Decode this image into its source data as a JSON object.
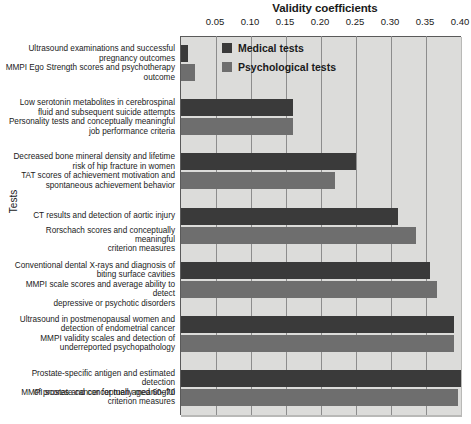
{
  "chart_data": {
    "type": "bar",
    "orientation": "horizontal",
    "title": "Validity coefficients",
    "xlabel": "Validity coefficients",
    "ylabel": "Tests",
    "xlim": [
      0.0,
      0.4
    ],
    "xticks": [
      0.05,
      0.1,
      0.15,
      0.2,
      0.25,
      0.3,
      0.35,
      0.4
    ],
    "xtick_labels": [
      "0.05",
      "0.10",
      "0.15",
      "0.20",
      "0.25",
      "0.30",
      "0.35",
      "0.40"
    ],
    "grid": true,
    "legend_position": "upper-center-inside",
    "categories": [
      "Ultrasound examinations and successful pregnancy outcomes",
      "MMPI Ego Strength scores and psychotherapy outcome",
      "Low serotonin metabolites in cerebrospinal fluid and subsequent suicide attempts",
      "Personality tests and conceptually meaningful job performance criteria",
      "Decreased bone mineral density and lifetime risk of hip fracture in women",
      "TAT scores of achievement motivation and spontaneous achievement behavior",
      "CT results and detection of aortic injury",
      "Rorschach scores and conceptually meaningful criterion measures",
      "Conventional dental X-rays and diagnosis of biting surface cavities",
      "MMPI scale scores and average ability to detect depressive or psychotic disorders",
      "Ultrasound in postmenopausal women and detection of endometrial cancer",
      "MMPI validity scales and detection of underreported psychopathology",
      "Prostate-specific antigen and estimated detection of prostate cancer for men aged 60–70",
      "MMPI scores and conceptually meaningful criterion measures"
    ],
    "series": [
      {
        "name": "Medical tests",
        "color": "#3a3a3a",
        "points": [
          {
            "label": "Ultrasound examinations and successful pregnancy outcomes",
            "value": 0.01
          },
          {
            "label": "Low serotonin metabolites in cerebrospinal fluid and subsequent suicide attempts",
            "value": 0.16
          },
          {
            "label": "Decreased bone mineral density and lifetime risk of hip fracture in women",
            "value": 0.25
          },
          {
            "label": "CT results and detection of aortic injury",
            "value": 0.31
          },
          {
            "label": "Conventional dental X-rays and diagnosis of biting surface cavities",
            "value": 0.355
          },
          {
            "label": "Ultrasound in postmenopausal women and detection of endometrial cancer",
            "value": 0.39
          },
          {
            "label": "Prostate-specific antigen and estimated detection of prostate cancer for men aged 60–70",
            "value": 0.4
          }
        ]
      },
      {
        "name": "Psychological tests",
        "color": "#6e6e6e",
        "points": [
          {
            "label": "MMPI Ego Strength scores and psychotherapy outcome",
            "value": 0.02
          },
          {
            "label": "Personality tests and conceptually meaningful job performance criteria",
            "value": 0.16
          },
          {
            "label": "TAT scores of achievement motivation and spontaneous achievement behavior",
            "value": 0.22
          },
          {
            "label": "Rorschach scores and conceptually meaningful criterion measures",
            "value": 0.335
          },
          {
            "label": "MMPI scale scores and average ability to detect depressive or psychotic disorders",
            "value": 0.365
          },
          {
            "label": "MMPI validity scales and detection of underreported psychopathology",
            "value": 0.39
          },
          {
            "label": "MMPI scores and conceptually meaningful criterion measures",
            "value": 0.395
          }
        ]
      }
    ],
    "bars": [
      {
        "series": "Medical tests",
        "label_line1": "Ultrasound examinations and successful",
        "label_line2": "pregnancy outcomes",
        "value": 0.01
      },
      {
        "series": "Psychological tests",
        "label_line1": "MMPI Ego Strength scores and psychotherapy",
        "label_line2": "outcome",
        "value": 0.02
      },
      {
        "series": "Medical tests",
        "label_line1": "Low serotonin metabolites in cerebrospinal",
        "label_line2": "fluid and subsequent suicide attempts",
        "value": 0.16
      },
      {
        "series": "Psychological tests",
        "label_line1": "Personality tests and conceptually meaningful",
        "label_line2": "job performance criteria",
        "value": 0.16
      },
      {
        "series": "Medical tests",
        "label_line1": "Decreased bone mineral density and lifetime",
        "label_line2": "risk of hip fracture in women",
        "value": 0.25
      },
      {
        "series": "Psychological tests",
        "label_line1": "TAT scores of achievement motivation and",
        "label_line2": "spontaneous achievement behavior",
        "value": 0.22
      },
      {
        "series": "Medical tests",
        "label_line1": "CT results and detection of aortic injury",
        "label_line2": "",
        "value": 0.31
      },
      {
        "series": "Psychological tests",
        "label_line1": "Rorschach scores and conceptually meaningful",
        "label_line2": "criterion measures",
        "value": 0.335
      },
      {
        "series": "Medical tests",
        "label_line1": "Conventional dental X-rays and diagnosis of",
        "label_line2": "biting surface cavities",
        "value": 0.355
      },
      {
        "series": "Psychological tests",
        "label_line1": "MMPI scale scores and average ability to detect",
        "label_line2": "depressive or psychotic disorders",
        "value": 0.365
      },
      {
        "series": "Medical tests",
        "label_line1": "Ultrasound in postmenopausal women and",
        "label_line2": "detection of endometrial cancer",
        "value": 0.39
      },
      {
        "series": "Psychological tests",
        "label_line1": "MMPI validity scales and detection of",
        "label_line2": "underreported psychopathology",
        "value": 0.39
      },
      {
        "series": "Medical tests",
        "label_line1": "Prostate-specific antigen and estimated detection",
        "label_line2": "of prostate cancer for men aged 60–70",
        "value": 0.4
      },
      {
        "series": "Psychological tests",
        "label_line1": "MMPI scores and conceptually meaningful",
        "label_line2": "criterion measures",
        "value": 0.395
      }
    ]
  },
  "legend": {
    "items": [
      {
        "label": "Medical tests",
        "color": "#3a3a3a"
      },
      {
        "label": "Psychological tests",
        "color": "#6e6e6e"
      }
    ]
  },
  "axes": {
    "x_title": "Validity coefficients",
    "y_title": "Tests"
  },
  "colors": {
    "medical": "#3a3a3a",
    "psychological": "#6e6e6e",
    "plot_background": "#dcdcda",
    "gridline": "#8d8d8d",
    "text": "#1a1a1a"
  }
}
